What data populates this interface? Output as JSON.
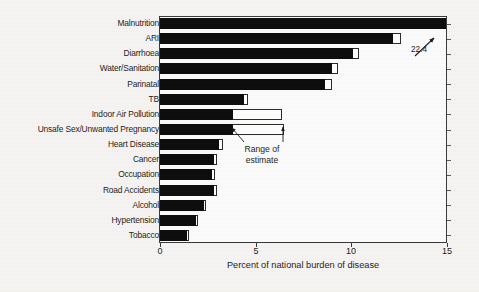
{
  "chart_data": {
    "type": "bar",
    "orientation": "horizontal",
    "title": "",
    "xlabel": "Percent of national burden of disease",
    "ylabel": "",
    "xlim": [
      0,
      15
    ],
    "xticks": [
      0,
      5,
      10,
      15
    ],
    "xtick_labels": [
      "0",
      "5",
      "10",
      "15"
    ],
    "grid": false,
    "legend": null,
    "categories": [
      "Malnutrition",
      "ARI",
      "Diarrhoea",
      "Water/Sanitation",
      "Parinatal",
      "TB",
      "Indoor Air Pollution",
      "Unsafe Sex/Unwanted Pregnancy",
      "Heart Disease",
      "Cancer",
      "Occupation",
      "Road Accidents",
      "Alcohol",
      "Hypertension",
      "Tobacco"
    ],
    "values": [
      22.4,
      12.2,
      10.1,
      9.0,
      8.6,
      4.4,
      3.8,
      3.8,
      3.1,
      2.8,
      2.7,
      2.8,
      2.3,
      1.9,
      1.4
    ],
    "range_high": [
      22.4,
      12.6,
      10.4,
      9.3,
      9.0,
      4.6,
      6.4,
      6.5,
      3.3,
      3.0,
      2.9,
      3.0,
      2.4,
      2.0,
      1.5
    ],
    "annotations": [
      {
        "name": "overflow-value",
        "text": "22.4",
        "target_category": "Malnutrition",
        "note": "bar extends beyond axis maximum"
      },
      {
        "name": "range-of-estimate",
        "text": "Range of\nestimate",
        "text_line1": "Range of",
        "text_line2": "estimate"
      }
    ]
  },
  "axis": {
    "x_title": "Percent of national burden of disease",
    "tick_labels": [
      "0",
      "5",
      "10",
      "15"
    ]
  },
  "annotations": {
    "overflow_label": "22.4",
    "range_line1": "Range of",
    "range_line2": "estimate"
  },
  "colors": {
    "bar_fill": "#0d0d0d",
    "range_fill": "#fdfdfc",
    "frame": "#3a3a3a",
    "text": "#1d1d1d",
    "background": "#f4f3f1"
  }
}
